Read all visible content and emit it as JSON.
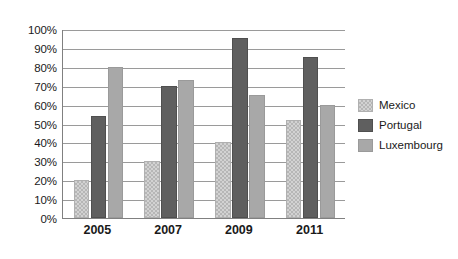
{
  "chart_data": {
    "type": "bar",
    "title": "",
    "subtitle": "",
    "xlabel": "",
    "ylabel": "",
    "categories": [
      "2005",
      "2007",
      "2009",
      "2011"
    ],
    "series": [
      {
        "name": "Mexico",
        "values": [
          20,
          30,
          40,
          52
        ],
        "color": "#d2d2d2"
      },
      {
        "name": "Portugal",
        "values": [
          54,
          70,
          95,
          85
        ],
        "color": "#5f5f5f"
      },
      {
        "name": "Luxembourg",
        "values": [
          80,
          73,
          65,
          60
        ],
        "color": "#a8a8a8"
      }
    ],
    "ylim": [
      0,
      100
    ],
    "ytick_values": [
      0,
      10,
      20,
      30,
      40,
      50,
      60,
      70,
      80,
      90,
      100
    ],
    "ytick_labels": [
      "0%",
      "10%",
      "20%",
      "30%",
      "40%",
      "50%",
      "60%",
      "70%",
      "80%",
      "90%",
      "100%"
    ],
    "grid": true,
    "grid_axis": "y",
    "legend_position": "right",
    "value_suffix": "%"
  },
  "legend": {
    "items": [
      {
        "label": "Mexico"
      },
      {
        "label": "Portugal"
      },
      {
        "label": "Luxembourg"
      }
    ]
  },
  "colors": {
    "mexico": "#d2d2d2",
    "portugal": "#5f5f5f",
    "luxembourg": "#a8a8a8",
    "gridline": "#9a9a9a",
    "axis": "#808080",
    "text": "#1a1a1a",
    "background": "#ffffff"
  }
}
